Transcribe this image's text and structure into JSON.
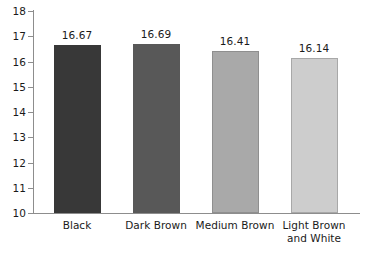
{
  "chart_data": {
    "type": "bar",
    "title": "",
    "subtitle": "",
    "xlabel": "",
    "ylabel": "",
    "ylim": [
      10,
      18
    ],
    "yticks": [
      10,
      11,
      12,
      13,
      14,
      15,
      16,
      17,
      18
    ],
    "ytick_labels": [
      "10",
      "11",
      "12",
      "13",
      "14",
      "15",
      "16",
      "17",
      "18"
    ],
    "grid": false,
    "legend": false,
    "legend_position": "none",
    "categories": [
      "Black",
      "Dark Brown",
      "Medium Brown",
      "Light Brown and White"
    ],
    "category_lines": [
      [
        "Black"
      ],
      [
        "Dark Brown"
      ],
      [
        "Medium Brown"
      ],
      [
        "Light Brown",
        "and White"
      ]
    ],
    "values": [
      16.67,
      16.69,
      16.41,
      16.14
    ],
    "value_labels": [
      "16.67",
      "16.69",
      "16.41",
      "16.14"
    ],
    "bar_colors": [
      "#383838",
      "#585858",
      "#a9a9a9",
      "#cdcdcd"
    ],
    "bar_borders": [
      "#383838",
      "#585858",
      "#8f8f8f",
      "#a8a8a8"
    ],
    "axis_color": "#8d8d8d",
    "text_color": "#1a1a1a",
    "background": "#ffffff"
  }
}
